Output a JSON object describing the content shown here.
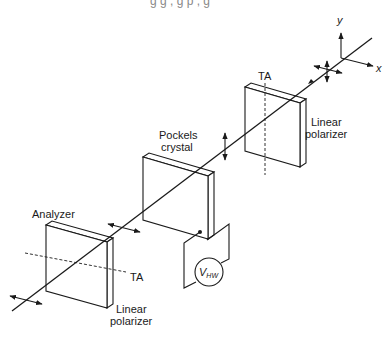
{
  "header_cutoff_text": "g     g ,         g     p       , g",
  "axes": {
    "x_label": "x",
    "y_label": "y"
  },
  "components": [
    {
      "id": "input-polarizer",
      "title": "Linear polarizer",
      "axis_label": "TA"
    },
    {
      "id": "pockels-crystal",
      "title_line1": "Pockels",
      "title_line2": "crystal"
    },
    {
      "id": "analyzer",
      "title": "Analyzer",
      "axis_label": "TA",
      "subtitle_line1": "Linear",
      "subtitle_line2": "polarizer"
    }
  ],
  "labels": {
    "input_polarizer_line1": "Linear",
    "input_polarizer_line2": "polarizer",
    "input_polarizer_ta": "TA",
    "pockels_line1": "Pockels",
    "pockels_line2": "crystal",
    "analyzer_title": "Analyzer",
    "analyzer_ta": "TA",
    "analyzer_line1": "Linear",
    "analyzer_line2": "polarizer",
    "voltage_main": "V",
    "voltage_sub": "HW"
  },
  "colors": {
    "ink": "#1a1a1a",
    "background": "#ffffff"
  }
}
